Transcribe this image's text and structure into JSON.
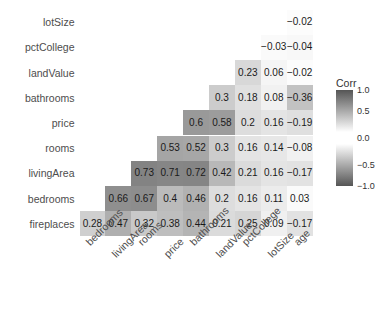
{
  "chart_data": {
    "type": "heatmap",
    "title": "",
    "legend_title": "Corr",
    "legend_position": "right",
    "grid": false,
    "xlabel": "",
    "ylabel": "",
    "zlim": [
      -1.0,
      1.0
    ],
    "legend_ticks": [
      "1.0",
      "0.5",
      "0.0",
      "-0.5",
      "-1.0"
    ],
    "legend_tick_values": [
      1.0,
      0.5,
      0.0,
      -0.5,
      -1.0
    ],
    "x_categories": [
      "bedrooms",
      "livingArea",
      "rooms",
      "price",
      "bathrooms",
      "landValue",
      "pctCollege",
      "lotSize",
      "age"
    ],
    "y_categories": [
      "lotSize",
      "pctCollege",
      "landValue",
      "bathrooms",
      "price",
      "rooms",
      "livingArea",
      "bedrooms",
      "fireplaces"
    ],
    "rows": [
      {
        "label": "lotSize",
        "values": [
          null,
          null,
          null,
          null,
          null,
          null,
          null,
          null,
          -0.02
        ],
        "texts": [
          null,
          null,
          null,
          null,
          null,
          null,
          null,
          null,
          "−0.02"
        ]
      },
      {
        "label": "pctCollege",
        "values": [
          null,
          null,
          null,
          null,
          null,
          null,
          null,
          -0.03,
          -0.04
        ],
        "texts": [
          null,
          null,
          null,
          null,
          null,
          null,
          null,
          "−0.03",
          "−0.04"
        ]
      },
      {
        "label": "landValue",
        "values": [
          null,
          null,
          null,
          null,
          null,
          null,
          0.23,
          0.06,
          -0.02
        ],
        "texts": [
          null,
          null,
          null,
          null,
          null,
          null,
          "0.23",
          "0.06",
          "−0.02"
        ]
      },
      {
        "label": "bathrooms",
        "values": [
          null,
          null,
          null,
          null,
          null,
          0.3,
          0.18,
          0.08,
          -0.36
        ],
        "texts": [
          null,
          null,
          null,
          null,
          null,
          "0.3",
          "0.18",
          "0.08",
          "−0.36"
        ]
      },
      {
        "label": "price",
        "values": [
          null,
          null,
          null,
          null,
          0.6,
          0.58,
          0.2,
          0.16,
          -0.19
        ],
        "texts": [
          null,
          null,
          null,
          null,
          "0.6",
          "0.58",
          "0.2",
          "0.16",
          "−0.19"
        ]
      },
      {
        "label": "rooms",
        "values": [
          null,
          null,
          null,
          0.53,
          0.52,
          0.3,
          0.16,
          0.14,
          -0.08
        ],
        "texts": [
          null,
          null,
          null,
          "0.53",
          "0.52",
          "0.3",
          "0.16",
          "0.14",
          "−0.08"
        ]
      },
      {
        "label": "livingArea",
        "values": [
          null,
          null,
          0.73,
          0.71,
          0.72,
          0.42,
          0.21,
          0.16,
          -0.17
        ],
        "texts": [
          null,
          null,
          "0.73",
          "0.71",
          "0.72",
          "0.42",
          "0.21",
          "0.16",
          "−0.17"
        ]
      },
      {
        "label": "bedrooms",
        "values": [
          null,
          0.66,
          0.67,
          0.4,
          0.46,
          0.2,
          0.16,
          0.11,
          0.03
        ],
        "texts": [
          null,
          "0.66",
          "0.67",
          "0.4",
          "0.46",
          "0.2",
          "0.16",
          "0.11",
          "0.03"
        ]
      },
      {
        "label": "fireplaces",
        "values": [
          0.28,
          0.47,
          0.32,
          0.38,
          0.44,
          0.21,
          0.25,
          0.09,
          -0.17
        ],
        "texts": [
          "0.28",
          "0.47",
          "0.32",
          "0.38",
          "0.44",
          "0.21",
          "0.25",
          "0.09",
          "−0.17"
        ]
      }
    ]
  }
}
